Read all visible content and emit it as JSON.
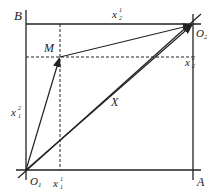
{
  "diagram": {
    "type": "edgeworth-box",
    "colors": {
      "ink": "#222222",
      "background": "#ffffff"
    },
    "corners": {
      "top_left": {
        "label": "B"
      },
      "top_right": {
        "label": "O",
        "sub": "2"
      },
      "bottom_right": {
        "label": "A"
      },
      "bottom_left": {
        "label": "O",
        "sub": "1"
      }
    },
    "point": {
      "label": "M"
    },
    "vector_label": "X",
    "axis_labels": {
      "bottom": {
        "base": "x",
        "sup": "1",
        "sub": "1"
      },
      "left": {
        "base": "x",
        "sup": "2",
        "sub": "1"
      },
      "top": {
        "base": "x",
        "sup": "1",
        "sub": "2"
      },
      "right": {
        "base": "x",
        "sup": "2",
        "sub": "2"
      }
    }
  }
}
